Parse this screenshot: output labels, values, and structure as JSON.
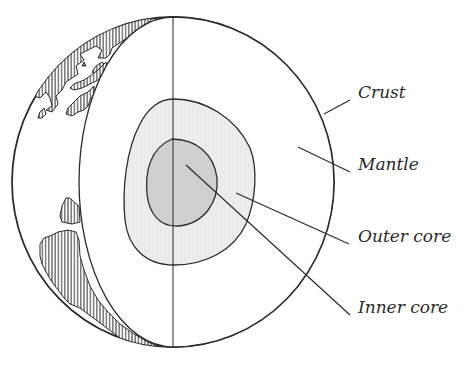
{
  "figure": {
    "labels": [
      {
        "id": "crust",
        "text": "Crust",
        "x": 358,
        "y": 84,
        "leader": [
          324,
          114,
          350,
          100
        ]
      },
      {
        "id": "mantle",
        "text": "Mantle",
        "x": 358,
        "y": 156,
        "leader": [
          298,
          147,
          350,
          172
        ]
      },
      {
        "id": "outer-core",
        "text": "Outer core",
        "x": 358,
        "y": 228,
        "leader": [
          236,
          193,
          349,
          244
        ]
      },
      {
        "id": "inner-core",
        "text": "Inner core",
        "x": 358,
        "y": 299,
        "leader": [
          186,
          165,
          350,
          315
        ]
      }
    ]
  },
  "colors": {
    "stroke": "#2b2b2b",
    "background": "#ffffff",
    "mantle": "#ffffff",
    "outer_core": "#ededed",
    "inner_core": "#cfcfcf",
    "land_hatch": "#333333",
    "text": "#2a2a2a"
  }
}
